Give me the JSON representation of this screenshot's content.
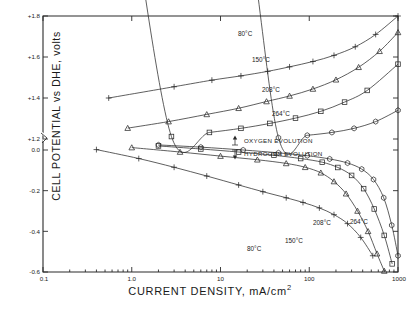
{
  "chart_data": {
    "type": "line",
    "title": "",
    "xlabel": "CURRENT DENSITY, mA/cm",
    "xlabel_sup": "2",
    "ylabel": "CELL POTENTIAL vs DHE, volts",
    "xscale": "log",
    "xlim": [
      0.1,
      1000
    ],
    "xticks": [
      0.1,
      1.0,
      10,
      100,
      1000
    ],
    "xticklabels": [
      "0.1",
      "1.0",
      "10",
      "100",
      "1000"
    ],
    "yscale": "linear-broken",
    "ylim_upper": [
      1.2,
      1.8
    ],
    "ylim_lower": [
      -0.6,
      0.0
    ],
    "yticks_upper": [
      1.8,
      1.6,
      1.4,
      1.2
    ],
    "yticklabels_upper": [
      "+1.8",
      "+1.6",
      "+1.4",
      "+1.2"
    ],
    "yticks_lower": [
      0.0,
      -0.2,
      -0.4,
      -0.6
    ],
    "yticklabels_lower": [
      "0.0",
      "-0.2",
      "-0.4",
      "-0.6"
    ],
    "axis_break": true,
    "grid": false,
    "legend_position": "center-right",
    "legend": [
      {
        "label": "OXYGEN EVOLUTION",
        "marker": "arrow-up",
        "name": "oxygen-evolution"
      },
      {
        "label": "HYDROGEN EVOLUTION",
        "marker": "arrow-down",
        "name": "hydrogen-evolution"
      }
    ],
    "annotations": [
      {
        "text": "80°C",
        "branch": "oxygen"
      },
      {
        "text": "150°C",
        "branch": "oxygen"
      },
      {
        "text": "208°C",
        "branch": "oxygen"
      },
      {
        "text": "264°C",
        "branch": "oxygen"
      },
      {
        "text": "80°C",
        "branch": "hydrogen"
      },
      {
        "text": "150°C",
        "branch": "hydrogen"
      },
      {
        "text": "208°C",
        "branch": "hydrogen"
      },
      {
        "text": "264°C",
        "branch": "hydrogen"
      }
    ],
    "series": [
      {
        "name": "oxygen-80C",
        "label": "80°C",
        "branch": "oxygen evolution",
        "marker": "plus",
        "x": [
          0.55,
          3.0,
          8.0,
          17.0,
          34.0,
          60.0,
          110.0,
          190.0,
          330.0,
          560.0,
          1000.0
        ],
        "y": [
          1.4,
          1.455,
          1.487,
          1.508,
          1.53,
          1.552,
          1.578,
          1.608,
          1.65,
          1.71,
          1.8
        ]
      },
      {
        "name": "oxygen-150C",
        "label": "150°C",
        "branch": "oxygen evolution",
        "marker": "triangle",
        "x": [
          0.9,
          2.6,
          7.0,
          16.0,
          33.0,
          60.0,
          110.0,
          200.0,
          360.0,
          620.0,
          1000.0
        ],
        "y": [
          1.253,
          1.285,
          1.32,
          1.35,
          1.383,
          1.41,
          1.444,
          1.489,
          1.55,
          1.628,
          1.72
        ]
      },
      {
        "name": "oxygen-208C",
        "label": "208°C",
        "branch": "oxygen evolution",
        "marker": "square",
        "x": [
          1.0,
          2.8,
          7.5,
          17.0,
          36.0,
          70.0,
          135.0,
          250.0,
          450.0,
          1000.0
        ],
        "y": [
          1.196,
          1.212,
          1.232,
          1.252,
          1.276,
          1.302,
          1.335,
          1.38,
          1.437,
          1.565
        ]
      },
      {
        "name": "oxygen-264C",
        "label": "264°C",
        "branch": "oxygen evolution",
        "marker": "hexagon",
        "x": [
          7.0,
          18.0,
          45.0,
          95.0,
          180.0,
          320.0,
          560.0,
          1000.0
        ],
        "y": [
          1.186,
          1.196,
          1.206,
          1.218,
          1.232,
          1.252,
          1.285,
          1.34
        ]
      },
      {
        "name": "hydrogen-80C",
        "label": "80°C",
        "branch": "hydrogen evolution",
        "marker": "plus",
        "x": [
          0.4,
          1.2,
          3.0,
          7.0,
          16.0,
          30.0,
          55.0,
          85.0,
          130.0,
          190.0,
          270.0,
          380.0,
          520.0
        ],
        "y": [
          0.002,
          -0.042,
          -0.085,
          -0.128,
          -0.172,
          -0.205,
          -0.235,
          -0.258,
          -0.285,
          -0.318,
          -0.362,
          -0.43,
          -0.52
        ]
      },
      {
        "name": "hydrogen-150C",
        "label": "150°C",
        "branch": "hydrogen evolution",
        "marker": "triangle",
        "x": [
          1.0,
          3.5,
          10.0,
          26.0,
          55.0,
          90.0,
          135.0,
          190.0,
          260.0,
          350.0,
          460.0,
          580.0,
          700.0
        ],
        "y": [
          0.012,
          -0.01,
          -0.03,
          -0.048,
          -0.066,
          -0.085,
          -0.112,
          -0.155,
          -0.215,
          -0.3,
          -0.4,
          -0.51,
          -0.595
        ]
      },
      {
        "name": "hydrogen-208C",
        "label": "208°C",
        "branch": "hydrogen evolution",
        "marker": "square",
        "x": [
          2.0,
          6.0,
          16.0,
          40.0,
          80.0,
          140.0,
          210.0,
          300.0,
          410.0,
          540.0,
          700.0,
          860.0
        ],
        "y": [
          0.02,
          0.005,
          -0.01,
          -0.026,
          -0.042,
          -0.06,
          -0.086,
          -0.125,
          -0.19,
          -0.29,
          -0.42,
          -0.56
        ]
      },
      {
        "name": "hydrogen-264C",
        "label": "264°C",
        "branch": "hydrogen evolution",
        "marker": "hexagon",
        "x": [
          2.0,
          6.0,
          18.0,
          45.0,
          95.0,
          170.0,
          270.0,
          390.0,
          530.0,
          690.0,
          850.0,
          1000.0
        ],
        "y": [
          0.025,
          0.014,
          0.0,
          -0.014,
          -0.028,
          -0.044,
          -0.064,
          -0.094,
          -0.145,
          -0.235,
          -0.37,
          -0.52
        ]
      }
    ]
  }
}
